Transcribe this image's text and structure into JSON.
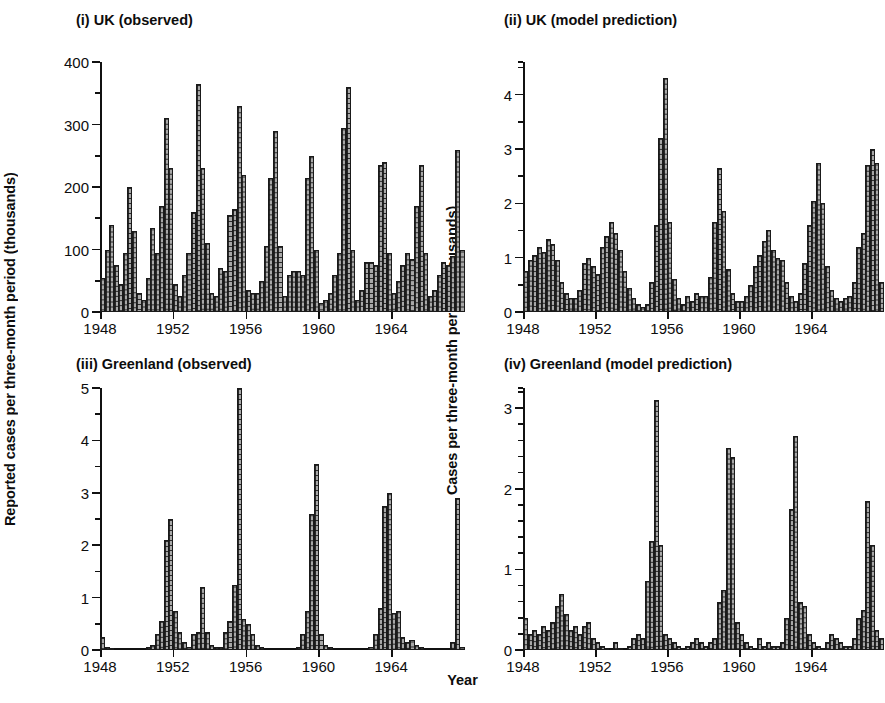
{
  "figure": {
    "xlabel": "Year",
    "ylabel_left": "Reported cases per three-month period (thousands)",
    "ylabel_right": "Cases per three-month period (thousands)"
  },
  "chart_data": [
    {
      "id": "panel-i",
      "type": "bar",
      "title": "(i) UK (observed)",
      "xlabel": "Year",
      "ylabel": "Reported cases per three-month period (thousands)",
      "xlim": [
        1948,
        1967.75
      ],
      "ylim": [
        0,
        400
      ],
      "ytick_labels": [
        "0",
        "100",
        "200",
        "300",
        "400"
      ],
      "yticks": [
        0,
        100,
        200,
        300,
        400
      ],
      "yminor_step": 50,
      "xtick_labels": [
        "1948",
        "1952",
        "1956",
        "1960",
        "1964"
      ],
      "xticks": [
        1948,
        1952,
        1956,
        1960,
        1964
      ],
      "grid": false,
      "legend": "none",
      "bar_period": "quarterly",
      "x": [
        1948,
        1948.25,
        1948.5,
        1948.75,
        1949,
        1949.25,
        1949.5,
        1949.75,
        1950,
        1950.25,
        1950.5,
        1950.75,
        1951,
        1951.25,
        1951.5,
        1951.75,
        1952,
        1952.25,
        1952.5,
        1952.75,
        1953,
        1953.25,
        1953.5,
        1953.75,
        1954,
        1954.25,
        1954.5,
        1954.75,
        1955,
        1955.25,
        1955.5,
        1955.75,
        1956,
        1956.25,
        1956.5,
        1956.75,
        1957,
        1957.25,
        1957.5,
        1957.75,
        1958,
        1958.25,
        1958.5,
        1958.75,
        1959,
        1959.25,
        1959.5,
        1959.75,
        1960,
        1960.25,
        1960.5,
        1960.75,
        1961,
        1961.25,
        1961.5,
        1961.75,
        1962,
        1962.25,
        1962.5,
        1962.75,
        1963,
        1963.25,
        1963.5,
        1963.75,
        1964,
        1964.25,
        1964.5,
        1964.75,
        1965,
        1965.25,
        1965.5,
        1965.75,
        1966,
        1966.25,
        1966.5,
        1966.75,
        1967,
        1967.25,
        1967.5,
        1967.75
      ],
      "values": [
        55,
        100,
        140,
        75,
        45,
        95,
        200,
        130,
        30,
        20,
        55,
        135,
        95,
        170,
        310,
        230,
        45,
        25,
        60,
        95,
        160,
        365,
        230,
        110,
        30,
        25,
        70,
        65,
        155,
        165,
        330,
        220,
        35,
        30,
        30,
        50,
        105,
        215,
        290,
        105,
        25,
        60,
        65,
        65,
        60,
        215,
        250,
        100,
        15,
        20,
        30,
        60,
        95,
        295,
        360,
        100,
        20,
        35,
        80,
        80,
        75,
        235,
        240,
        95,
        30,
        50,
        75,
        95,
        85,
        170,
        235,
        95,
        25,
        35,
        60,
        80,
        75,
        90,
        260,
        100
      ]
    },
    {
      "id": "panel-ii",
      "type": "bar",
      "title": "(ii) UK (model prediction)",
      "xlabel": "Year",
      "ylabel": "Cases per three-month period (thousands)",
      "xlim": [
        1948,
        1967.75
      ],
      "ylim": [
        0,
        4.6
      ],
      "ytick_labels": [
        "0",
        "1",
        "2",
        "3",
        "4"
      ],
      "yticks": [
        0,
        1,
        2,
        3,
        4
      ],
      "yminor_step": 0.5,
      "xtick_labels": [
        "1948",
        "1952",
        "1956",
        "1960",
        "1964"
      ],
      "xticks": [
        1948,
        1952,
        1956,
        1960,
        1964
      ],
      "grid": false,
      "legend": "none",
      "bar_period": "quarterly",
      "x": [
        1948,
        1948.25,
        1948.5,
        1948.75,
        1949,
        1949.25,
        1949.5,
        1949.75,
        1950,
        1950.25,
        1950.5,
        1950.75,
        1951,
        1951.25,
        1951.5,
        1951.75,
        1952,
        1952.25,
        1952.5,
        1952.75,
        1953,
        1953.25,
        1953.5,
        1953.75,
        1954,
        1954.25,
        1954.5,
        1954.75,
        1955,
        1955.25,
        1955.5,
        1955.75,
        1956,
        1956.25,
        1956.5,
        1956.75,
        1957,
        1957.25,
        1957.5,
        1957.75,
        1958,
        1958.25,
        1958.5,
        1958.75,
        1959,
        1959.25,
        1959.5,
        1959.75,
        1960,
        1960.25,
        1960.5,
        1960.75,
        1961,
        1961.25,
        1961.5,
        1961.75,
        1962,
        1962.25,
        1962.5,
        1962.75,
        1963,
        1963.25,
        1963.5,
        1963.75,
        1964,
        1964.25,
        1964.5,
        1964.75,
        1965,
        1965.25,
        1965.5,
        1965.75,
        1966,
        1966.25,
        1966.5,
        1966.75,
        1967,
        1967.25,
        1967.5,
        1967.75
      ],
      "values": [
        0.75,
        0.95,
        1.05,
        1.2,
        1.1,
        1.35,
        1.25,
        0.95,
        0.55,
        0.35,
        0.25,
        0.25,
        0.4,
        0.9,
        1.0,
        0.85,
        0.7,
        1.2,
        1.4,
        1.65,
        1.45,
        1.15,
        0.75,
        0.45,
        0.25,
        0.15,
        0.1,
        0.15,
        0.55,
        1.6,
        3.2,
        4.3,
        1.65,
        0.6,
        0.25,
        0.15,
        0.3,
        0.2,
        0.35,
        0.3,
        0.3,
        0.65,
        1.65,
        2.65,
        1.85,
        0.8,
        0.35,
        0.2,
        0.2,
        0.3,
        0.5,
        0.85,
        1.05,
        1.3,
        1.5,
        1.15,
        1.0,
        0.95,
        0.55,
        0.3,
        0.2,
        0.35,
        0.9,
        1.6,
        2.05,
        2.75,
        2.0,
        0.85,
        0.4,
        0.25,
        0.2,
        0.25,
        0.3,
        0.55,
        1.2,
        1.45,
        2.7,
        3.0,
        2.75,
        0.55
      ]
    },
    {
      "id": "panel-iii",
      "type": "bar",
      "title": "(iii) Greenland (observed)",
      "xlabel": "Year",
      "ylabel": "Reported cases per three-month period (thousands)",
      "xlim": [
        1948,
        1967.75
      ],
      "ylim": [
        0,
        5
      ],
      "ytick_labels": [
        "0",
        "1",
        "2",
        "3",
        "4",
        "5"
      ],
      "yticks": [
        0,
        1,
        2,
        3,
        4,
        5
      ],
      "yminor_step": 0.5,
      "xtick_labels": [
        "1948",
        "1952",
        "1956",
        "1960",
        "1964"
      ],
      "xticks": [
        1948,
        1952,
        1956,
        1960,
        1964
      ],
      "grid": false,
      "legend": "none",
      "bar_period": "quarterly",
      "x": [
        1948,
        1948.25,
        1948.5,
        1948.75,
        1949,
        1949.25,
        1949.5,
        1949.75,
        1950,
        1950.25,
        1950.5,
        1950.75,
        1951,
        1951.25,
        1951.5,
        1951.75,
        1952,
        1952.25,
        1952.5,
        1952.75,
        1953,
        1953.25,
        1953.5,
        1953.75,
        1954,
        1954.25,
        1954.5,
        1954.75,
        1955,
        1955.25,
        1955.5,
        1955.75,
        1956,
        1956.25,
        1956.5,
        1956.75,
        1957,
        1957.25,
        1957.5,
        1957.75,
        1958,
        1958.25,
        1958.5,
        1958.75,
        1959,
        1959.25,
        1959.5,
        1959.75,
        1960,
        1960.25,
        1960.5,
        1960.75,
        1961,
        1961.25,
        1961.5,
        1961.75,
        1962,
        1962.25,
        1962.5,
        1962.75,
        1963,
        1963.25,
        1963.5,
        1963.75,
        1964,
        1964.25,
        1964.5,
        1964.75,
        1965,
        1965.25,
        1965.5,
        1965.75,
        1966,
        1966.25,
        1966.5,
        1966.75,
        1967,
        1967.25,
        1967.5,
        1967.75
      ],
      "values": [
        0.25,
        0.05,
        0.02,
        0.0,
        0.0,
        0.0,
        0.0,
        0.0,
        0.0,
        0.0,
        0.05,
        0.1,
        0.3,
        0.55,
        2.1,
        2.5,
        0.75,
        0.35,
        0.15,
        0.05,
        0.3,
        0.35,
        1.2,
        0.35,
        0.1,
        0.05,
        0.05,
        0.35,
        0.55,
        1.25,
        5.0,
        0.6,
        0.5,
        0.3,
        0.1,
        0.05,
        0.0,
        0.0,
        0.0,
        0.0,
        0.0,
        0.0,
        0.0,
        0.05,
        0.3,
        0.75,
        2.6,
        3.55,
        0.3,
        0.1,
        0.05,
        0.0,
        0.0,
        0.0,
        0.0,
        0.0,
        0.0,
        0.0,
        0.0,
        0.05,
        0.3,
        0.8,
        2.75,
        3.0,
        0.7,
        0.75,
        0.25,
        0.15,
        0.2,
        0.1,
        0.05,
        0.0,
        0.0,
        0.0,
        0.0,
        0.0,
        0.0,
        0.15,
        2.9,
        0.05
      ]
    },
    {
      "id": "panel-iv",
      "type": "bar",
      "title": "(iv) Greenland (model prediction)",
      "xlabel": "Year",
      "ylabel": "Cases per three-month period (thousands)",
      "xlim": [
        1948,
        1967.75
      ],
      "ylim": [
        0,
        3.25
      ],
      "ytick_labels": [
        "0",
        "1",
        "2",
        "3"
      ],
      "yticks": [
        0,
        1,
        2,
        3
      ],
      "yminor_step": 0.2,
      "xtick_labels": [
        "1948",
        "1952",
        "1956",
        "1960",
        "1964"
      ],
      "xticks": [
        1948,
        1952,
        1956,
        1960,
        1964
      ],
      "grid": false,
      "legend": "none",
      "bar_period": "quarterly",
      "x": [
        1948,
        1948.25,
        1948.5,
        1948.75,
        1949,
        1949.25,
        1949.5,
        1949.75,
        1950,
        1950.25,
        1950.5,
        1950.75,
        1951,
        1951.25,
        1951.5,
        1951.75,
        1952,
        1952.25,
        1952.5,
        1952.75,
        1953,
        1953.25,
        1953.5,
        1953.75,
        1954,
        1954.25,
        1954.5,
        1954.75,
        1955,
        1955.25,
        1955.5,
        1955.75,
        1956,
        1956.25,
        1956.5,
        1956.75,
        1957,
        1957.25,
        1957.5,
        1957.75,
        1958,
        1958.25,
        1958.5,
        1958.75,
        1959,
        1959.25,
        1959.5,
        1959.75,
        1960,
        1960.25,
        1960.5,
        1960.75,
        1961,
        1961.25,
        1961.5,
        1961.75,
        1962,
        1962.25,
        1962.5,
        1962.75,
        1963,
        1963.25,
        1963.5,
        1963.75,
        1964,
        1964.25,
        1964.5,
        1964.75,
        1965,
        1965.25,
        1965.5,
        1965.75,
        1966,
        1966.25,
        1966.5,
        1966.75,
        1967,
        1967.25,
        1967.5,
        1967.75
      ],
      "values": [
        0.4,
        0.2,
        0.25,
        0.2,
        0.3,
        0.25,
        0.35,
        0.55,
        0.7,
        0.45,
        0.25,
        0.3,
        0.2,
        0.3,
        0.35,
        0.15,
        0.1,
        0.05,
        0.02,
        0.0,
        0.1,
        0.02,
        0.0,
        0.05,
        0.15,
        0.2,
        0.15,
        0.85,
        1.35,
        3.1,
        1.3,
        0.2,
        0.15,
        0.1,
        0.05,
        0.02,
        0.05,
        0.1,
        0.15,
        0.1,
        0.05,
        0.1,
        0.15,
        0.6,
        0.75,
        2.5,
        2.4,
        0.35,
        0.2,
        0.1,
        0.05,
        0.0,
        0.15,
        0.05,
        0.1,
        0.05,
        0.05,
        0.1,
        0.4,
        1.75,
        2.65,
        0.6,
        0.55,
        0.2,
        0.1,
        0.05,
        0.02,
        0.1,
        0.2,
        0.15,
        0.1,
        0.05,
        0.05,
        0.15,
        0.4,
        0.5,
        1.85,
        1.3,
        0.25,
        0.15
      ]
    }
  ]
}
